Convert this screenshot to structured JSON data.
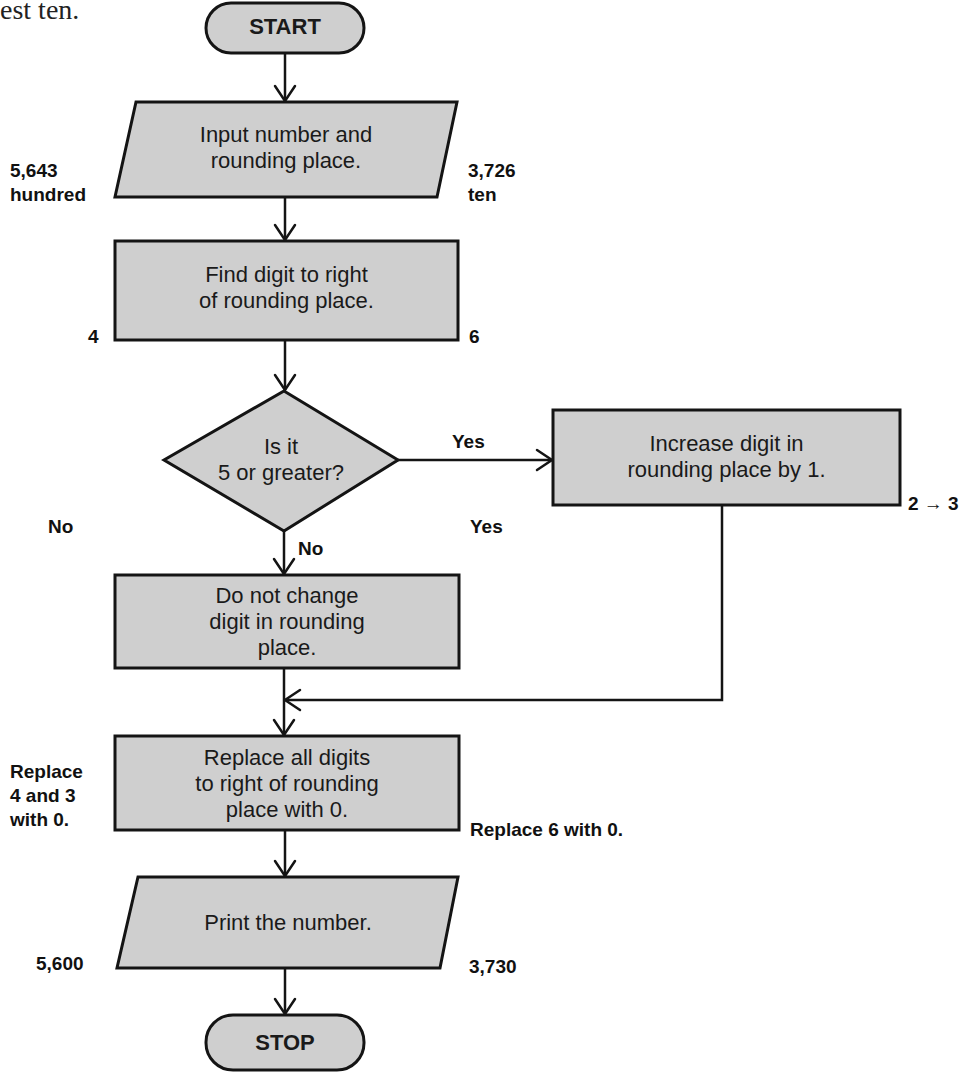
{
  "caption_fragment": "est ten.",
  "flowchart": {
    "start": "START",
    "input": "Input number and\nrounding place.",
    "find": "Find digit to right\nof rounding place.",
    "decision": "Is it\n5 or greater?",
    "increase": "Increase digit in\nrounding place by 1.",
    "no_change": "Do not change\ndigit in rounding\nplace.",
    "replace": "Replace all digits\nto right of rounding\nplace with 0.",
    "print": "Print the number.",
    "stop": "STOP",
    "edge_yes": "Yes",
    "edge_no": "No"
  },
  "example_left": {
    "input": "5,643\nhundred",
    "digit": "4",
    "decision": "No",
    "replace": "Replace\n4 and 3\nwith 0.",
    "output": "5,600"
  },
  "example_right": {
    "input": "3,726\nten",
    "digit": "6",
    "decision": "Yes",
    "increase": "2 → 3",
    "replace": "Replace 6 with 0.",
    "output": "3,730"
  },
  "colors": {
    "shape_fill": "#cfcfcf",
    "stroke": "#141414"
  }
}
